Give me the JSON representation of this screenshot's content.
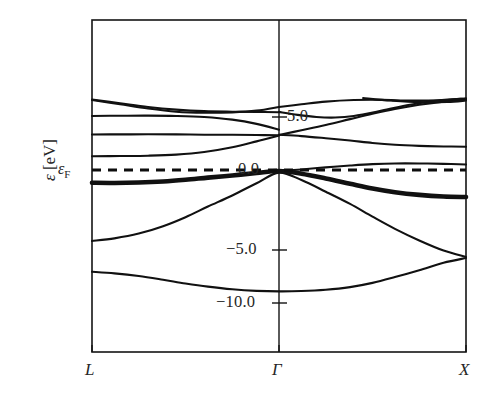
{
  "figure": {
    "title": "",
    "background_color": "#ffffff",
    "line_color": "#111111"
  },
  "axes": {
    "ylabel_symbol": "ε",
    "ylabel_units": " [eV]",
    "fermi_symbol": "ε",
    "fermi_subscript": "F",
    "ytick_labels": [
      "5.0",
      "0.0",
      "−5.0",
      "−10.0"
    ],
    "xtick_labels": [
      "L",
      "Γ",
      "X"
    ]
  },
  "chart_data": {
    "type": "line",
    "xlabel": "",
    "ylabel": "ε [eV]",
    "ylim": [
      -12.5,
      6.8
    ],
    "xlim": [
      0,
      2
    ],
    "grid": false,
    "legend": "none",
    "x_tick_positions": [
      0,
      1,
      2
    ],
    "x_tick_labels": [
      "L",
      "Γ",
      "X"
    ],
    "y_ticks": [
      5.0,
      0.0,
      -5.0,
      -10.0
    ],
    "y_tick_labels": [
      "5.0",
      "0.0",
      "−5.0",
      "−10.0"
    ],
    "annotations": [
      {
        "text": "ε_F",
        "y": 0.0,
        "style": "dashed horizontal line at Fermi level"
      }
    ],
    "series": [
      {
        "name": "valence-band-1-lowest",
        "weight": "normal",
        "x": [
          0.0,
          0.12,
          0.25,
          0.38,
          0.5,
          0.62,
          0.75,
          0.88,
          1.0,
          1.12,
          1.25,
          1.38,
          1.5,
          1.62,
          1.75,
          1.88,
          2.0
        ],
        "y": [
          -9.6,
          -9.75,
          -10.0,
          -10.35,
          -10.7,
          -11.0,
          -11.25,
          -11.4,
          -11.45,
          -11.42,
          -11.3,
          -11.05,
          -10.65,
          -10.1,
          -9.45,
          -8.75,
          -8.3
        ]
      },
      {
        "name": "valence-band-2",
        "weight": "normal",
        "x": [
          0.0,
          0.12,
          0.25,
          0.38,
          0.5,
          0.62,
          0.75,
          0.88,
          1.0,
          1.12,
          1.25,
          1.38,
          1.5,
          1.62,
          1.75,
          1.88,
          2.0
        ],
        "y": [
          -6.7,
          -6.45,
          -6.0,
          -5.3,
          -4.45,
          -3.45,
          -2.4,
          -1.25,
          -0.25,
          -0.95,
          -2.05,
          -3.2,
          -4.4,
          -5.55,
          -6.65,
          -7.6,
          -8.2
        ]
      },
      {
        "name": "valence-band-3-flat-heavy",
        "weight": "heavy",
        "x": [
          0.0,
          0.12,
          0.25,
          0.38,
          0.5,
          0.62,
          0.75,
          0.88,
          1.0,
          1.12,
          1.25,
          1.38,
          1.5,
          1.62,
          1.75,
          1.88,
          2.0
        ],
        "y": [
          -1.2,
          -1.22,
          -1.18,
          -1.08,
          -0.92,
          -0.72,
          -0.52,
          -0.28,
          -0.1,
          -0.35,
          -0.8,
          -1.3,
          -1.75,
          -2.1,
          -2.35,
          -2.5,
          -2.55
        ]
      },
      {
        "name": "conduction-band-1",
        "weight": "normal",
        "x": [
          1.0,
          1.12,
          1.25,
          1.38,
          1.5,
          1.62,
          1.75,
          1.88,
          2.0
        ],
        "y": [
          -0.1,
          0.05,
          0.25,
          0.42,
          0.55,
          0.62,
          0.62,
          0.58,
          0.52
        ]
      },
      {
        "name": "flat-band-L-left-lower",
        "weight": "normal",
        "x": [
          0.0,
          0.15,
          0.3,
          0.45,
          0.6,
          0.75,
          0.88,
          1.0
        ],
        "y": [
          1.3,
          1.32,
          1.35,
          1.45,
          1.7,
          2.15,
          2.7,
          3.25
        ]
      },
      {
        "name": "flat-band-L-mid",
        "weight": "normal",
        "x": [
          0.0,
          0.15,
          0.3,
          0.45,
          0.6,
          0.75,
          0.88,
          1.0
        ],
        "y": [
          3.35,
          3.36,
          3.37,
          3.36,
          3.33,
          3.32,
          3.3,
          3.28
        ]
      },
      {
        "name": "band-L-upper-flat",
        "weight": "normal",
        "x": [
          0.0,
          0.15,
          0.3,
          0.45,
          0.6,
          0.75,
          0.88,
          1.0
        ],
        "y": [
          5.1,
          5.12,
          5.13,
          5.1,
          5.0,
          4.75,
          4.35,
          3.8
        ]
      },
      {
        "name": "band-L-steep-a",
        "weight": "normal",
        "x": [
          0.0,
          0.15,
          0.3,
          0.45,
          0.6,
          0.75,
          0.88,
          1.0
        ],
        "y": [
          6.65,
          6.3,
          5.95,
          5.7,
          5.55,
          5.5,
          5.48,
          5.45
        ]
      },
      {
        "name": "band-L-steep-b",
        "weight": "normal",
        "x": [
          0.0,
          0.15,
          0.3,
          0.45,
          0.6,
          0.75,
          0.88,
          1.0
        ],
        "y": [
          6.6,
          6.2,
          5.8,
          5.5,
          5.4,
          5.44,
          5.6,
          5.95
        ]
      },
      {
        "name": "band-gamma-X-steep-up",
        "weight": "normal",
        "x": [
          1.0,
          1.12,
          1.25,
          1.38,
          1.5,
          1.62,
          1.75,
          1.88,
          2.0
        ],
        "y": [
          3.3,
          3.75,
          4.25,
          4.8,
          5.3,
          5.75,
          6.15,
          6.45,
          6.62
        ]
      },
      {
        "name": "band-gamma-X-mid-down",
        "weight": "normal",
        "x": [
          1.0,
          1.12,
          1.25,
          1.38,
          1.5,
          1.62,
          1.75,
          1.88,
          2.0
        ],
        "y": [
          3.32,
          3.2,
          3.0,
          2.78,
          2.55,
          2.38,
          2.28,
          2.22,
          2.2
        ]
      },
      {
        "name": "band-gamma-X-upper-v",
        "weight": "normal",
        "x": [
          1.0,
          1.1,
          1.2,
          1.3,
          1.4,
          1.55,
          1.7,
          1.85,
          2.0
        ],
        "y": [
          5.48,
          5.2,
          5.0,
          4.95,
          5.1,
          5.6,
          6.15,
          6.55,
          6.75
        ]
      },
      {
        "name": "band-gamma-X-upper-arc",
        "weight": "normal",
        "x": [
          1.0,
          1.12,
          1.25,
          1.4,
          1.55,
          1.7,
          1.85,
          2.0
        ],
        "y": [
          5.95,
          6.2,
          6.45,
          6.6,
          6.62,
          6.55,
          6.58,
          6.75
        ]
      },
      {
        "name": "band-X-top-right",
        "weight": "normal",
        "x": [
          1.45,
          1.6,
          1.75,
          1.9,
          2.0
        ],
        "y": [
          6.78,
          6.55,
          6.4,
          6.42,
          6.55
        ]
      }
    ]
  },
  "geometry": {
    "plot_left_px": 92,
    "plot_right_px": 466,
    "plot_top_px": 20,
    "plot_bottom_px": 352,
    "gamma_x_px": 279,
    "zero_y_px": 170,
    "px_per_ev": 10.6
  }
}
